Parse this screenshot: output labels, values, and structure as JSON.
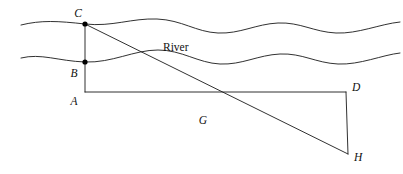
{
  "figure": {
    "background_color": "#ffffff",
    "stroke_color": "#1a1a1a",
    "label_color": "#111111",
    "width": 403,
    "height": 174,
    "river_label": "River",
    "points": [
      {
        "id": "C",
        "label": "C",
        "x": 85,
        "y": 24,
        "label_x": 78,
        "label_y": 17,
        "dot": true
      },
      {
        "id": "B",
        "label": "B",
        "x": 85,
        "y": 62,
        "label_x": 74,
        "label_y": 77,
        "dot": true
      },
      {
        "id": "A",
        "label": "A",
        "x": 85,
        "y": 92,
        "label_x": 74,
        "label_y": 105,
        "dot": false
      },
      {
        "id": "D",
        "label": "D",
        "x": 346,
        "y": 92,
        "label_x": 352,
        "label_y": 91,
        "dot": false
      },
      {
        "id": "H",
        "label": "H",
        "x": 348,
        "y": 154,
        "label_x": 354,
        "label_y": 161,
        "dot": false
      },
      {
        "id": "G",
        "label": "G",
        "x": 208,
        "y": 118,
        "label_x": 203,
        "label_y": 124,
        "dot": false
      }
    ],
    "segments": [
      {
        "id": "CA",
        "from": "C",
        "to": "A",
        "note": "vertical segment through B"
      },
      {
        "id": "AD",
        "from": "A",
        "to": "D",
        "note": "horizontal baseline"
      },
      {
        "id": "DH",
        "from": "D",
        "to": "H",
        "note": "vertical right side"
      },
      {
        "id": "CH",
        "from": "C",
        "to": "H",
        "note": "diagonal sight line crossing river"
      }
    ],
    "river": {
      "label": "River",
      "label_x": 163,
      "label_y": 51,
      "bank_top_path": "M 21,25 C 41,20 58,21 85,24 C 112,27 132,18 157,19 C 182,20 196,32 218,33 C 240,34 256,24 278,23 C 300,22 314,32 336,33 C 358,34 380,24 400,22",
      "bank_bottom_path": "M 21,58 C 41,53 58,61 85,62 C 112,63 134,50 158,50 C 182,50 198,63 220,64 C 242,65 258,55 280,54 C 302,53 316,63 338,64 C 360,65 382,55 400,53"
    }
  }
}
